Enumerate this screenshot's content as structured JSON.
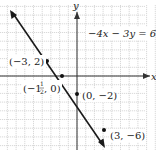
{
  "chart_data": {
    "type": "line",
    "title": "",
    "xlabel": "x",
    "ylabel": "y",
    "equation": "−4x − 3y = 6",
    "xlim": [
      -9,
      9
    ],
    "ylim": [
      -8.5,
      9
    ],
    "grid": true,
    "series": [
      {
        "name": "−4x − 3y = 6",
        "x": [
          -7.5,
          3.0
        ],
        "y": [
          7.5,
          -6.0
        ]
      }
    ],
    "points": [
      {
        "x": -3,
        "y": 2,
        "label": "(−3, 2)"
      },
      {
        "x": -1.5,
        "y": 0,
        "label": "(−1½, 0)"
      },
      {
        "x": 0,
        "y": -2,
        "label": "(0, −2)"
      },
      {
        "x": 3,
        "y": -6,
        "label": "(3, −6)"
      }
    ]
  },
  "labels": {
    "x_axis": "x",
    "y_axis": "y",
    "equation": "−4x − 3y = 6",
    "p1": "(−3, 2)",
    "p2_open": "(−1",
    "p2_num": "1",
    "p2_den": "2",
    "p2_close": ", 0)",
    "p3": "(0, −2)",
    "p4": "(3, −6)"
  },
  "colors": {
    "grid": "#c8c8c8",
    "axis": "#333333",
    "line": "#1a1a1a"
  }
}
